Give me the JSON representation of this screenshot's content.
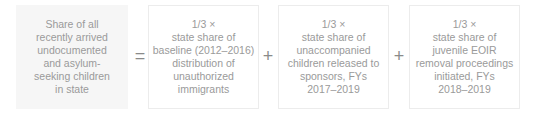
{
  "formula": {
    "lhs": {
      "lines": [
        "Share of all",
        "recently arrived",
        "undocumented",
        "and asylum-",
        "seeking children",
        "in state"
      ]
    },
    "operators": [
      "=",
      "+",
      "+"
    ],
    "terms": [
      {
        "lines": [
          "1/3 ×",
          "state share of",
          "baseline (2012–2016)",
          "distribution of",
          "unauthorized",
          "immigrants"
        ]
      },
      {
        "lines": [
          "1/3 ×",
          "state share of",
          "unaccompanied",
          "children released to",
          "sponsors, FYs",
          "2017–2019"
        ]
      },
      {
        "lines": [
          "1/3 ×",
          "state share of",
          "juvenile EOIR",
          "removal proceedings",
          "initiated, FYs",
          "2018–2019"
        ]
      }
    ]
  },
  "colors": {
    "text": "#9a9a9a",
    "lhs_background": "#f6f6f6",
    "term_border": "#ececec"
  }
}
